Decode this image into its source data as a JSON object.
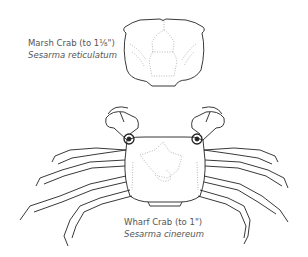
{
  "illustration": {
    "marsh_crab": {
      "common_name": "Marsh Crab (to 1⅛\")",
      "scientific_name": "Sesarma reticulatum"
    },
    "wharf_crab": {
      "common_name": "Wharf Crab (to 1\")",
      "scientific_name": "Sesarma cinereum"
    },
    "style": {
      "line_color": "#222222",
      "dotted_color": "#999999",
      "background": "#ffffff"
    }
  }
}
